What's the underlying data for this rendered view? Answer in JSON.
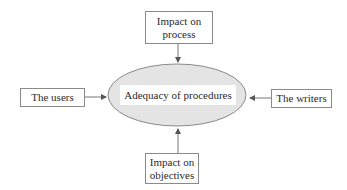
{
  "diagram": {
    "center": {
      "label": "Adequacy of procedures",
      "fill": "#e4e4e4",
      "stroke": "#8a8a8a"
    },
    "nodes": [
      {
        "id": "top",
        "label_line1": "Impact on",
        "label_line2": "process",
        "direction": "down"
      },
      {
        "id": "left",
        "label": "The users",
        "direction": "right"
      },
      {
        "id": "right",
        "label": "The writers",
        "direction": "left"
      },
      {
        "id": "bottom",
        "label_line1": "Impact on",
        "label_line2": "objectives",
        "direction": "up"
      }
    ],
    "edges": [
      {
        "from": "Impact on process",
        "to": "Adequacy of procedures"
      },
      {
        "from": "The users",
        "to": "Adequacy of procedures"
      },
      {
        "from": "The writers",
        "to": "Adequacy of procedures"
      },
      {
        "from": "Impact on objectives",
        "to": "Adequacy of procedures"
      }
    ]
  }
}
